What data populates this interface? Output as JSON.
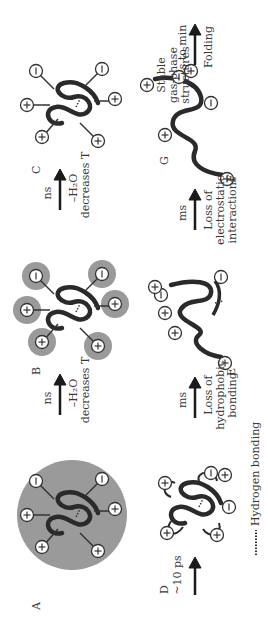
{
  "figure": {
    "orientation": "rotated-90-ccw",
    "panels": [
      {
        "id": "A",
        "label": "A",
        "description": "solvated protein in droplet",
        "charges": [
          "+",
          "+",
          "+",
          "-",
          "+",
          "-"
        ]
      },
      {
        "id": "B",
        "label": "B",
        "description": "partially desolvated protein with solvated charges",
        "charges": [
          "+",
          "+",
          "+",
          "-",
          "+",
          "-"
        ]
      },
      {
        "id": "C",
        "label": "C",
        "description": "desolvated native-like protein",
        "charges": [
          "+",
          "+",
          "+",
          "-",
          "+",
          "-"
        ]
      },
      {
        "id": "D",
        "label": "D",
        "description": "self-solvated compact structure"
      },
      {
        "id": "E",
        "label": "E",
        "description": "partially unfolded structure"
      },
      {
        "id": "F",
        "label": "F",
        "description": "extended unfolded structure"
      },
      {
        "id": "G",
        "label": "G",
        "description": "stable gas-phase structures"
      }
    ],
    "arrows": [
      {
        "from": "A",
        "to": "B",
        "time": "ns",
        "line1": "–H₂O",
        "line2": "decreases T"
      },
      {
        "from": "B",
        "to": "C",
        "time": "ns",
        "line1": "–H₂O",
        "line2": "decreases T"
      },
      {
        "from": "start",
        "to": "D",
        "time": "D",
        "line1": "~10 ps"
      },
      {
        "from": "D",
        "to": "E",
        "time": "ms",
        "line1": "Loss of",
        "line2": "hydrophobic",
        "line3": "bonding"
      },
      {
        "from": "E",
        "to": "F",
        "time": "ms",
        "line1": "Loss of",
        "line2": "electrostatic",
        "line3": "interactions"
      },
      {
        "from": "F",
        "to": "G",
        "time": "s to min",
        "line1": "Folding"
      }
    ],
    "g_text": {
      "line1": "Stable",
      "line2": "gas-phase",
      "line3": "structures"
    },
    "legend": {
      "symbol": "………",
      "text": "Hydrogen bonding"
    },
    "colors": {
      "solvent": "#9a9a9a",
      "chain": "#2a2a2a",
      "ion_fill": "#ffffff"
    }
  }
}
